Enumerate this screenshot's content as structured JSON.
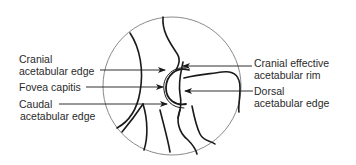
{
  "figure": {
    "type": "radiograph-tracing",
    "labels_left": [
      {
        "id": "cranial-acetabular-edge",
        "line1": "Cranial",
        "line2": "acetabular edge"
      },
      {
        "id": "fovea-capitis",
        "line1": "Fovea capitis",
        "line2": ""
      },
      {
        "id": "caudal-acetabular-edge",
        "line1": "Caudal",
        "line2": "acetabular edge"
      }
    ],
    "labels_right": [
      {
        "id": "cranial-effective-acetabular-rim",
        "line1": "Cranial effective",
        "line2": "acetabular rim"
      },
      {
        "id": "dorsal-acetabular-edge",
        "line1": "Dorsal",
        "line2": "acetabular edge"
      }
    ],
    "colors": {
      "ink": "#1a1a1a",
      "circle": "#8a8a8a",
      "text": "#2a2a2a"
    }
  }
}
